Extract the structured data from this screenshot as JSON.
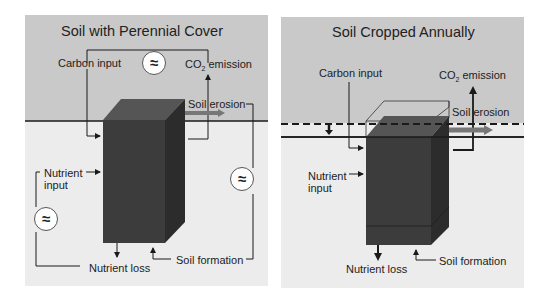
{
  "panels": [
    {
      "title": "Soil with Perennial Cover",
      "labels": {
        "carbon_input": "Carbon input",
        "co2_emission_prefix": "CO",
        "co2_emission_sub": "2",
        "co2_emission_suffix": " emission",
        "soil_erosion": "Soil erosion",
        "nutrient_input_line1": "Nutrient",
        "nutrient_input_line2": "input",
        "nutrient_loss": "Nutrient loss",
        "soil_formation": "Soil formation"
      },
      "balance_symbol": "≈",
      "balance_symbols_count": 3
    },
    {
      "title": "Soil Cropped Annually",
      "labels": {
        "carbon_input": "Carbon input",
        "co2_emission_prefix": "CO",
        "co2_emission_sub": "2",
        "co2_emission_suffix": " emission",
        "soil_erosion": "Soil erosion",
        "nutrient_input_line1": "Nutrient",
        "nutrient_input_line2": "input",
        "nutrient_loss": "Nutrient loss",
        "soil_formation": "Soil formation"
      }
    }
  ],
  "colors": {
    "sky": "#c9c9c9",
    "ground": "#ececec",
    "soil_front": "#3c3c3c",
    "soil_top": "#555555",
    "soil_side": "#2c2c2c",
    "erosion_arrow": "#777777",
    "line": "#1a1a1a"
  }
}
